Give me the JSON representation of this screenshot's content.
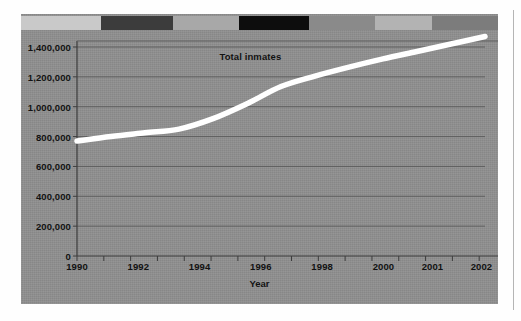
{
  "figure": {
    "panel_color": "#8e8e8e",
    "line_color": "#ffffff",
    "text_color": "#121212",
    "gridline_color": "#5f5f5f",
    "axis_color": "#3d3d3d",
    "page_rule_color": "#b5b5b5",
    "deco_bar": [
      {
        "name": "segment-1",
        "color": "#c9c9c9",
        "width": 80
      },
      {
        "name": "segment-2",
        "color": "#3c3c3c",
        "width": 72
      },
      {
        "name": "segment-3",
        "color": "#a8a8a8",
        "width": 66
      },
      {
        "name": "segment-4",
        "color": "#0d0d0d",
        "width": 70
      },
      {
        "name": "segment-5",
        "color": "#8a8a8a",
        "width": 66
      },
      {
        "name": "segment-6",
        "color": "#b3b3b3",
        "width": 57
      },
      {
        "name": "segment-7",
        "color": "#7c7c7c",
        "width": 66
      }
    ]
  },
  "chart_data": {
    "type": "line",
    "title": "",
    "xlabel": "Year",
    "ylabel": "",
    "series_label": "Total inmates",
    "grid": true,
    "legend_position": "inline-annotation",
    "xlim": [
      1990,
      2002
    ],
    "ylim": [
      0,
      1400000
    ],
    "ytick_labels": [
      "1,400,000",
      "1,200,000",
      "1,000,000",
      "800,000",
      "600,000",
      "400,000",
      "200,000",
      "0"
    ],
    "ytick_values": [
      1400000,
      1200000,
      1000000,
      800000,
      600000,
      400000,
      200000,
      0
    ],
    "xtick_labels": [
      "1990",
      "1992",
      "1994",
      "1996",
      "1998",
      "2000",
      "2001",
      "2002"
    ],
    "xtick_values": [
      1990,
      1992,
      1994,
      1996,
      1998,
      2000,
      2001,
      2002
    ],
    "x": [
      1990,
      1991,
      1992,
      1993,
      1994,
      1995,
      1996,
      1997,
      1998,
      1999,
      2000,
      2001,
      2002
    ],
    "values": [
      770000,
      800000,
      825000,
      850000,
      920000,
      1020000,
      1135000,
      1205000,
      1265000,
      1320000,
      1370000,
      1420000,
      1470000
    ],
    "series": [
      {
        "name": "Total inmates",
        "values": [
          770000,
          800000,
          825000,
          850000,
          920000,
          1020000,
          1135000,
          1205000,
          1265000,
          1320000,
          1370000,
          1420000,
          1470000
        ]
      }
    ],
    "annotation": {
      "text": "Total inmates",
      "x": 1995.1,
      "y": 1330000
    }
  }
}
